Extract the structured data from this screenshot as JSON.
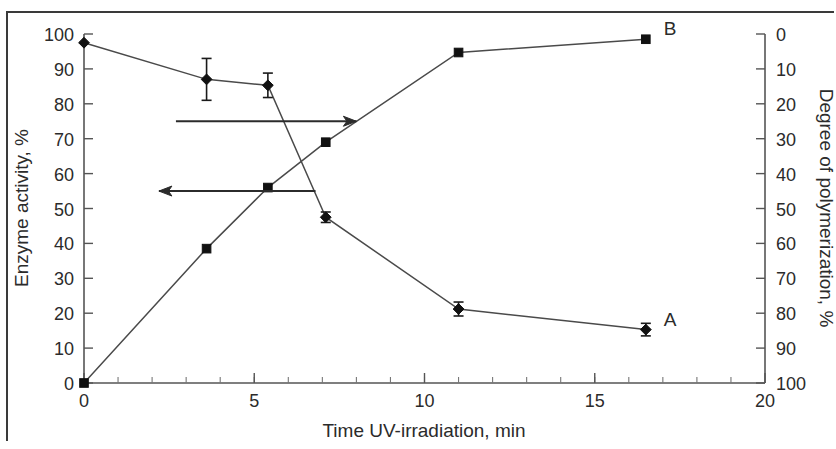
{
  "figure": {
    "background_color": "#ffffff",
    "ink_color": "#2b2b2b",
    "frame_color": "#3a3a3a"
  },
  "chart_data": {
    "type": "line",
    "title": "",
    "subtitle": "",
    "xlabel": "Time UV-irradiation, min",
    "ylabel": "Enzyme activity, %",
    "y2label": "Degree of polymerization, %",
    "xlim": [
      0,
      20
    ],
    "ylim": [
      0,
      100
    ],
    "y2lim": [
      0,
      100
    ],
    "y2_inverted": true,
    "grid": false,
    "legend_position": "inline-right",
    "xticks": [
      0,
      5,
      10,
      15,
      20
    ],
    "xticklabels": [
      "0",
      "5",
      "10",
      "15",
      "20"
    ],
    "x_minor_tick_step": 1,
    "yticks": [
      0,
      10,
      20,
      30,
      40,
      50,
      60,
      70,
      80,
      90,
      100
    ],
    "yticklabels": [
      "0",
      "10",
      "20",
      "30",
      "40",
      "50",
      "60",
      "70",
      "80",
      "90",
      "100"
    ],
    "y2ticks": [
      0,
      10,
      20,
      30,
      40,
      50,
      60,
      70,
      80,
      90,
      100
    ],
    "y2ticklabels": [
      "0",
      "10",
      "20",
      "30",
      "40",
      "50",
      "60",
      "70",
      "80",
      "90",
      "100"
    ],
    "series": [
      {
        "name": "A",
        "label": "A",
        "axis": "left",
        "marker": "diamond",
        "x": [
          0,
          3.6,
          5.4,
          7.1,
          11.0,
          16.5
        ],
        "values": [
          97.5,
          87.0,
          85.3,
          47.5,
          21.2,
          15.3
        ],
        "yerr": [
          0,
          6.0,
          3.5,
          1.5,
          2.0,
          1.8
        ]
      },
      {
        "name": "B",
        "label": "B",
        "axis": "right",
        "marker": "square",
        "x": [
          0,
          3.6,
          5.4,
          7.1,
          11.0,
          16.5
        ],
        "values": [
          100.0,
          61.5,
          44.0,
          31.0,
          5.3,
          1.5
        ],
        "yerr": [
          0,
          0,
          0,
          0,
          0,
          0
        ]
      }
    ],
    "annotations": [
      {
        "name": "arrow-to-right-axis",
        "text": "",
        "direction": "right",
        "y_value": 75,
        "x_start": 2.7,
        "x_end": 8.0
      },
      {
        "name": "arrow-to-left-axis",
        "text": "",
        "direction": "left",
        "y_value": 55,
        "x_start": 6.8,
        "x_end": 2.2
      }
    ]
  }
}
